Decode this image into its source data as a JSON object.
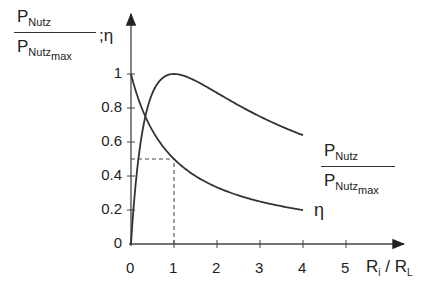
{
  "chart_data": {
    "type": "line",
    "title": "",
    "ylabel": "P_Nutz / P_Nutz_max ; η",
    "ylabel_parts": {
      "num_main": "P",
      "num_sub": "Nutz",
      "den_main": "P",
      "den_sub": "Nutz",
      "den_subsub": "max",
      "suffix": ";η"
    },
    "xlabel": "R_i / R_L",
    "xlabel_parts": {
      "a": "R",
      "a_sub": "i",
      "sep": " / ",
      "b": "R",
      "b_sub": "L"
    },
    "xlim": [
      0,
      5.6
    ],
    "ylim": [
      0,
      1.1
    ],
    "x_ticks": [
      "0",
      "1",
      "2",
      "3",
      "4",
      "5"
    ],
    "y_ticks": [
      "0",
      "0.2",
      "0.4",
      "0.6",
      "0.8",
      "1"
    ],
    "grid": false,
    "series": [
      {
        "name": "P_Nutz / P_Nutz_max",
        "formula": "4x/(1+x)^2",
        "x": [
          0,
          0.25,
          0.5,
          0.75,
          1,
          1.5,
          2,
          2.5,
          3,
          3.5,
          4
        ],
        "values": [
          0,
          0.64,
          0.889,
          0.98,
          1.0,
          0.96,
          0.889,
          0.816,
          0.75,
          0.691,
          0.64
        ],
        "label": {
          "num_main": "P",
          "num_sub": "Nutz",
          "den_main": "P",
          "den_sub": "Nutz",
          "den_subsub": "max"
        }
      },
      {
        "name": "η",
        "formula": "1/(1+x)",
        "x": [
          0,
          0.25,
          0.5,
          0.75,
          1,
          1.5,
          2,
          2.5,
          3,
          3.5,
          4
        ],
        "values": [
          1.0,
          0.8,
          0.667,
          0.571,
          0.5,
          0.4,
          0.333,
          0.286,
          0.25,
          0.222,
          0.2
        ],
        "label": "η"
      }
    ],
    "annotations": [
      {
        "type": "dashed-guide",
        "from": [
          0,
          0.5
        ],
        "to": [
          1,
          0.5
        ]
      },
      {
        "type": "dashed-guide",
        "from": [
          1,
          0
        ],
        "to": [
          1,
          0.5
        ]
      }
    ]
  }
}
